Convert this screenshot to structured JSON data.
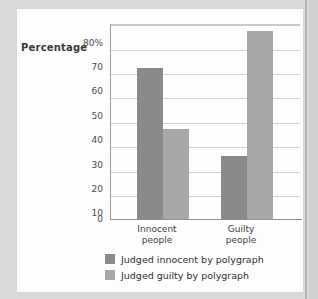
{
  "chart_data": {
    "type": "bar",
    "title": "",
    "xlabel": "",
    "ylabel": "Percentage",
    "categories": [
      "Innocent\npeople",
      "Guilty\npeople"
    ],
    "category_lines": [
      [
        "Innocent",
        "people"
      ],
      [
        "Guilty",
        "people"
      ]
    ],
    "series": [
      {
        "name": "Judged innocent by polygraph",
        "color": "#8a8a8a",
        "values": [
          62,
          26
        ]
      },
      {
        "name": "Judged guilty by polygraph",
        "color": "#a8a8a8",
        "values": [
          37,
          77
        ]
      }
    ],
    "ylim": [
      0,
      80
    ],
    "yticks": [
      80,
      70,
      60,
      50,
      40,
      30,
      20,
      10,
      0
    ],
    "ytick_labels": [
      "80%",
      "70",
      "60",
      "50",
      "40",
      "30",
      "20",
      "10",
      "0"
    ],
    "grid": true,
    "legend_position": "bottom"
  },
  "colors": {
    "series_dark": "#8a8a8a",
    "series_light": "#a8a8a8",
    "gridline": "#d2d2d2",
    "axis": "#8f8f8f",
    "card_background": "#fdfdfd",
    "page_background": "#d9d9d9"
  }
}
